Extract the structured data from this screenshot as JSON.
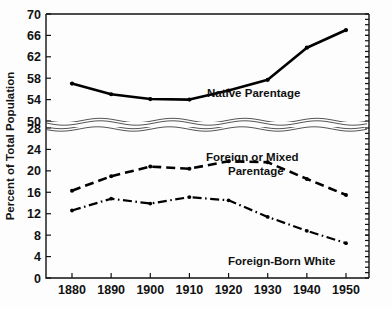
{
  "chart_data": {
    "type": "line",
    "title": "",
    "subtitle": "",
    "xlabel": "",
    "ylabel": "Percent of Total Population",
    "x": [
      1880,
      1890,
      1900,
      1910,
      1920,
      1930,
      1940,
      1950
    ],
    "categories": [
      "1880",
      "1890",
      "1900",
      "1910",
      "1920",
      "1930",
      "1940",
      "1950"
    ],
    "grid": false,
    "legend_position": "inline-annotations",
    "axis_break": {
      "present": true,
      "style": "wavy-double-line",
      "upper_segment_range": [
        50,
        70
      ],
      "lower_segment_range": [
        0,
        28
      ]
    },
    "upper_axis": {
      "ticks": [
        50,
        54,
        58,
        62,
        66,
        70
      ],
      "tick_labels": [
        "50",
        "54",
        "58",
        "62",
        "66",
        "70"
      ],
      "ylim": [
        50,
        70
      ]
    },
    "lower_axis": {
      "ticks": [
        0,
        4,
        8,
        12,
        16,
        20,
        24,
        28
      ],
      "tick_labels": [
        "0",
        "4",
        "8",
        "12",
        "16",
        "20",
        "24",
        "28"
      ],
      "ylim": [
        0,
        28
      ]
    },
    "series": [
      {
        "name": "Native Parentage",
        "annotation": "Native Parentage",
        "line_style": "solid",
        "panel": "upper",
        "values": [
          57.0,
          55.0,
          54.1,
          54.0,
          55.7,
          57.7,
          63.7,
          67.0
        ]
      },
      {
        "name": "Foreign or Mixed Parentage",
        "annotation_line1": "Foreign or Mixed",
        "annotation_line2": "Parentage",
        "line_style": "dashed",
        "panel": "lower",
        "values": [
          16.3,
          19.0,
          20.8,
          20.4,
          21.8,
          21.6,
          18.5,
          15.5
        ]
      },
      {
        "name": "Foreign-Born White",
        "annotation": "Foreign-Born White",
        "line_style": "dash-dot",
        "panel": "lower",
        "values": [
          12.6,
          14.8,
          13.9,
          15.1,
          14.5,
          11.4,
          8.8,
          6.5
        ]
      }
    ]
  },
  "colors": {
    "background": "#fdfdfd",
    "ink": "#111111",
    "line": "#000000",
    "break_line": "#555555"
  }
}
